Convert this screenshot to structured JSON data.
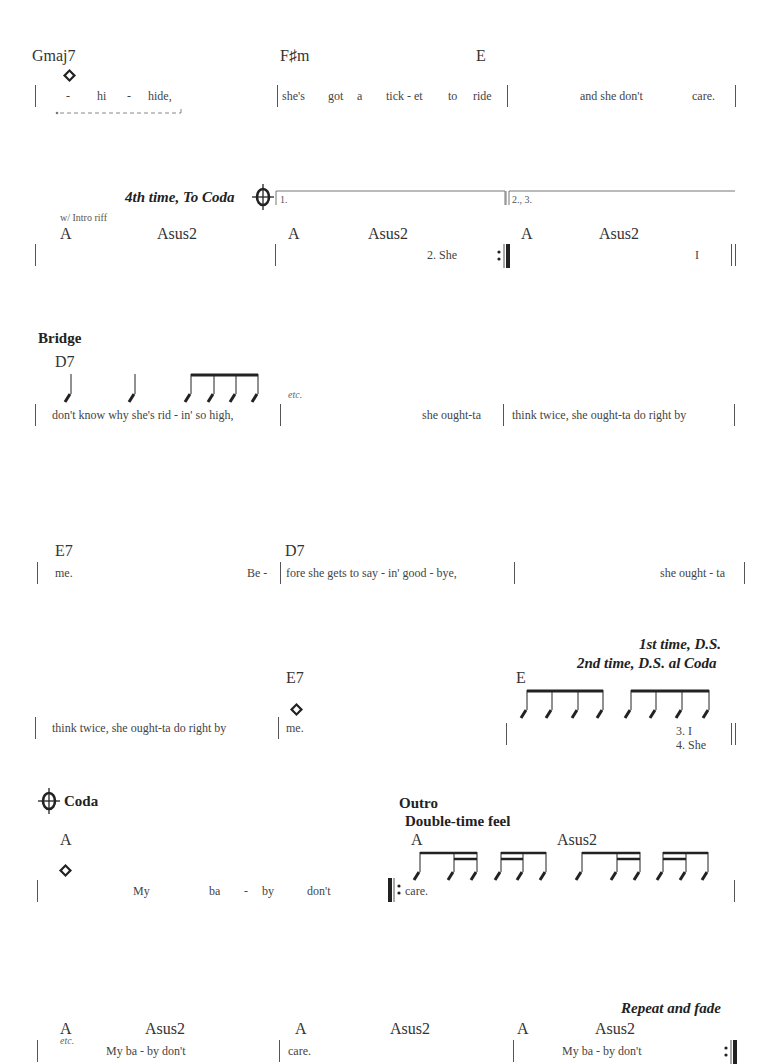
{
  "systems": [
    {
      "chords": [
        "Gmaj7",
        "F♯m",
        "E"
      ],
      "lyrics": {
        "m1": [
          "-",
          "hi",
          "-",
          "hide,"
        ],
        "m2": [
          "she's",
          "got",
          "a",
          "tick - et",
          "to",
          "ride"
        ],
        "m3": [
          "and she don't",
          "care."
        ]
      }
    },
    {
      "direction": "4th time, To Coda",
      "riff_note": "w/ Intro riff",
      "endings": [
        "1.",
        "2., 3."
      ],
      "chords": [
        "A",
        "Asus2",
        "A",
        "Asus2",
        "A",
        "Asus2"
      ],
      "lyrics": {
        "m2": "2.  She",
        "m3": "I"
      }
    },
    {
      "section": "Bridge",
      "chords": [
        "D7"
      ],
      "etc": "etc.",
      "lyrics": {
        "m1": "don't know why she's rid - in' so  high,",
        "m2": "she ought-ta",
        "m3": "think twice, she ought-ta do right by"
      }
    },
    {
      "chords": [
        "E7",
        "D7"
      ],
      "lyrics": {
        "m1a": "me.",
        "m1b": "Be  -",
        "m2": "fore she gets  to  say - in' good - bye,",
        "m3": "she ought - ta"
      }
    },
    {
      "direction_line1": "1st time, D.S.",
      "direction_line2": "2nd time, D.S. al Coda",
      "chords": [
        "E7",
        "E"
      ],
      "lyrics": {
        "m1": "think twice, she ought-ta do right   by",
        "m2": "me.",
        "verse3": "3.    I",
        "verse4": "4.  She"
      }
    },
    {
      "coda_label": "Coda",
      "outro_label": "Outro",
      "feel_label": "Double-time feel",
      "chords": [
        "A",
        "A",
        "Asus2"
      ],
      "lyrics": {
        "m1": [
          "My",
          "ba",
          "-",
          "by",
          "don't"
        ],
        "m2": "care."
      }
    },
    {
      "direction": "Repeat and fade",
      "etc": "etc.",
      "chords": [
        "A",
        "Asus2",
        "A",
        "Asus2",
        "A",
        "Asus2"
      ],
      "lyrics": {
        "m1": "My         ba  -  by   don't",
        "m2": "care.",
        "m3": "My        ba - by  don't"
      }
    }
  ]
}
